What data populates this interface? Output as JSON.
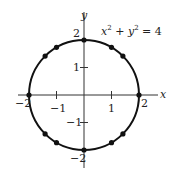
{
  "chart_data": {
    "type": "scatter",
    "title": "",
    "annotation": "x^2 + y^2 = 4",
    "equation": {
      "lhs_x": "x",
      "exp1": "2",
      "plus": "+",
      "lhs_y": "y",
      "exp2": "2",
      "eq": "= 4"
    },
    "xlabel": "x",
    "ylabel": "y",
    "xlim": [
      -2.3,
      2.3
    ],
    "ylim": [
      -2.3,
      2.3
    ],
    "xticks": [
      -2,
      -1,
      1,
      2
    ],
    "yticks": [
      -2,
      -1,
      1,
      2
    ],
    "xtick_labels": [
      "−2",
      "−1",
      "1",
      "2"
    ],
    "ytick_labels": [
      "−2",
      "−1",
      "1",
      "2"
    ],
    "grid": false,
    "curve": {
      "type": "circle",
      "center": [
        0,
        0
      ],
      "radius": 2
    },
    "points": [
      {
        "x": 2,
        "y": 0
      },
      {
        "x": 1.414,
        "y": 1.414
      },
      {
        "x": 1,
        "y": 1.732
      },
      {
        "x": 0,
        "y": 2
      },
      {
        "x": -1,
        "y": 1.732
      },
      {
        "x": -1.414,
        "y": 1.414
      },
      {
        "x": -2,
        "y": 0
      },
      {
        "x": -1.414,
        "y": -1.414
      },
      {
        "x": -1,
        "y": -1.732
      },
      {
        "x": 0,
        "y": -2
      },
      {
        "x": 1,
        "y": -1.732
      },
      {
        "x": 1.414,
        "y": -1.414
      }
    ],
    "colors": {
      "curve": "#111111",
      "axes": "#333333",
      "points": "#111111"
    }
  }
}
